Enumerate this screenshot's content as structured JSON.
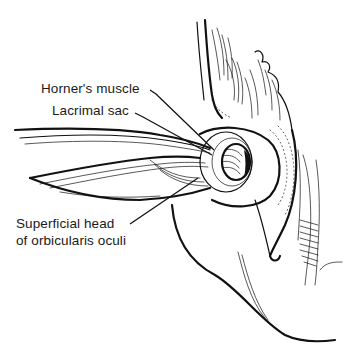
{
  "figure": {
    "type": "anatomical line drawing"
  },
  "labels": [
    {
      "id": "horner",
      "text": "Horner's muscle"
    },
    {
      "id": "lacrimal_sac",
      "text": "Lacrimal sac"
    },
    {
      "id": "superficial_head",
      "lines": [
        "Superficial head",
        "of orbicularis oculi"
      ]
    }
  ],
  "colors": {
    "ink": "#111111",
    "background": "#ffffff"
  }
}
